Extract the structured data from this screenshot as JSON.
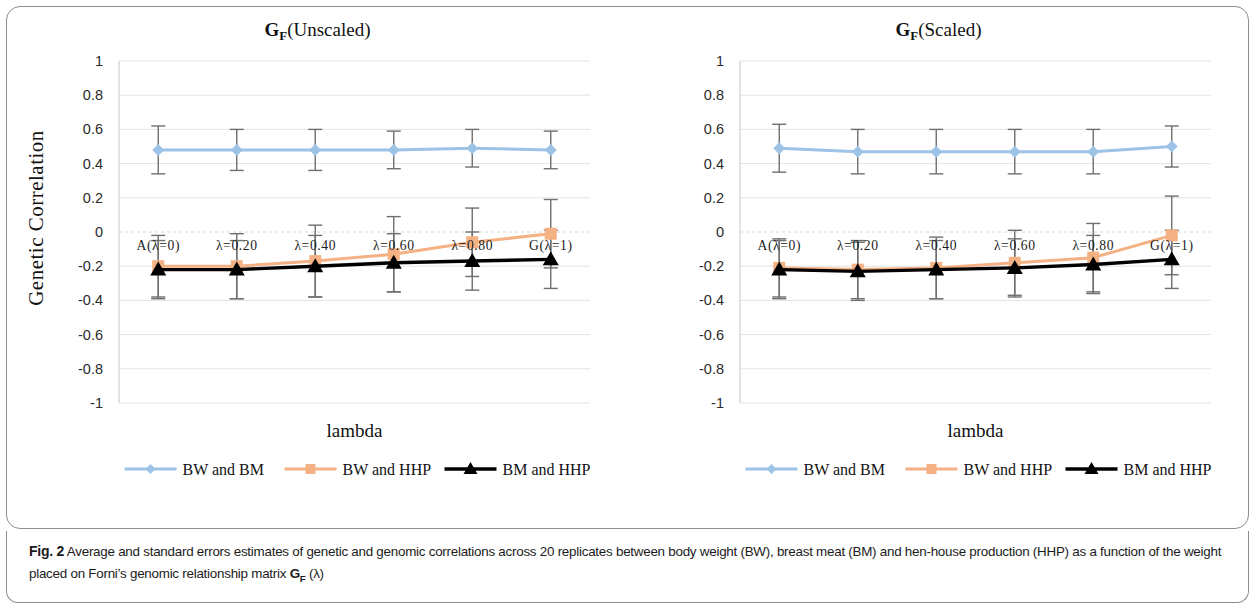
{
  "figure": {
    "caption_label": "Fig. 2",
    "caption_part1": "Average and standard errors estimates of genetic and genomic correlations across 20 replicates between body weight (BW), breast meat (BM) and hen-house production (HHP) as a function of the weight placed on Forni’s genomic relationship matrix ",
    "caption_gf": "G",
    "caption_gf_sub": "F",
    "caption_part2": " (λ)"
  },
  "colors": {
    "series_bw_bm": "#9dc3e6",
    "series_bw_hhp": "#f4b183",
    "series_bm_hhp": "#000000",
    "errorbar": "#6f6f6f",
    "grid": "#e3e3e3",
    "axis": "#d0d0d0",
    "panel_border": "#8d8d8d",
    "text": "#1a1a1a"
  },
  "legend": {
    "items": [
      {
        "label": "BW and BM",
        "color": "#9dc3e6",
        "marker": "diamond"
      },
      {
        "label": "BW and HHP",
        "color": "#f4b183",
        "marker": "square"
      },
      {
        "label": "BM and HHP",
        "color": "#000000",
        "marker": "triangle"
      }
    ]
  },
  "chart_data": [
    {
      "type": "line",
      "id": "gf-unscaled",
      "title_prefix": "G",
      "title_sub": "F",
      "title_suffix": "(Unscaled)",
      "title": "G_F(Unscaled)",
      "xlabel": "lambda",
      "ylabel": "Genetic  Correlation",
      "categories": [
        "A(λ=0)",
        "λ=0.20",
        "λ=0.40",
        "λ=0.60",
        "λ=0.80",
        "G(λ=1)"
      ],
      "yticks": [
        1,
        0.8,
        0.6,
        0.4,
        0.2,
        0,
        -0.2,
        -0.4,
        -0.6,
        -0.8,
        -1
      ],
      "ytick_labels": [
        "1",
        "0.8",
        "0.6",
        "0.4",
        "0.2",
        "0",
        "-0.2",
        "-0.4",
        "-0.6",
        "-0.8",
        "-1"
      ],
      "ylim": [
        -1,
        1
      ],
      "grid": true,
      "legend_position": "bottom",
      "series": [
        {
          "name": "BW and BM",
          "color": "#9dc3e6",
          "marker": "diamond",
          "values": [
            0.48,
            0.48,
            0.48,
            0.48,
            0.49,
            0.48
          ],
          "errors": [
            0.14,
            0.12,
            0.12,
            0.11,
            0.11,
            0.11
          ]
        },
        {
          "name": "BW and HHP",
          "color": "#f4b183",
          "marker": "square",
          "values": [
            -0.2,
            -0.2,
            -0.17,
            -0.13,
            -0.06,
            -0.01
          ],
          "errors": [
            0.18,
            0.19,
            0.21,
            0.22,
            0.2,
            0.2
          ]
        },
        {
          "name": "BM and HHP",
          "color": "#000000",
          "marker": "triangle",
          "values": [
            -0.22,
            -0.22,
            -0.2,
            -0.18,
            -0.17,
            -0.16
          ],
          "errors": [
            0.17,
            0.17,
            0.18,
            0.17,
            0.17,
            0.17
          ]
        }
      ]
    },
    {
      "type": "line",
      "id": "gf-scaled",
      "title_prefix": "G",
      "title_sub": "F",
      "title_suffix": "(Scaled)",
      "title": "G_F(Scaled)",
      "xlabel": "lambda",
      "ylabel": "Genetic  Correlation",
      "categories": [
        "A(λ=0)",
        "λ=0.20",
        "λ=0.40",
        "λ=0.60",
        "λ=0.80",
        "G(λ=1)"
      ],
      "yticks": [
        1,
        0.8,
        0.6,
        0.4,
        0.2,
        0,
        -0.2,
        -0.4,
        -0.6,
        -0.8,
        -1
      ],
      "ytick_labels": [
        "1",
        "0.8",
        "0.6",
        "0.4",
        "0.2",
        "0",
        "-0.2",
        "-0.4",
        "-0.6",
        "-0.8",
        "-1"
      ],
      "ylim": [
        -1,
        1
      ],
      "grid": true,
      "legend_position": "bottom",
      "series": [
        {
          "name": "BW and BM",
          "color": "#9dc3e6",
          "marker": "diamond",
          "values": [
            0.49,
            0.47,
            0.47,
            0.47,
            0.47,
            0.5
          ],
          "errors": [
            0.14,
            0.13,
            0.13,
            0.13,
            0.13,
            0.12
          ]
        },
        {
          "name": "BW and HHP",
          "color": "#f4b183",
          "marker": "square",
          "values": [
            -0.21,
            -0.22,
            -0.21,
            -0.18,
            -0.15,
            -0.02
          ],
          "errors": [
            0.17,
            0.17,
            0.18,
            0.19,
            0.2,
            0.23
          ]
        },
        {
          "name": "BM and HHP",
          "color": "#000000",
          "marker": "triangle",
          "values": [
            -0.22,
            -0.23,
            -0.22,
            -0.21,
            -0.19,
            -0.16
          ],
          "errors": [
            0.17,
            0.17,
            0.17,
            0.17,
            0.17,
            0.17
          ]
        }
      ]
    }
  ]
}
